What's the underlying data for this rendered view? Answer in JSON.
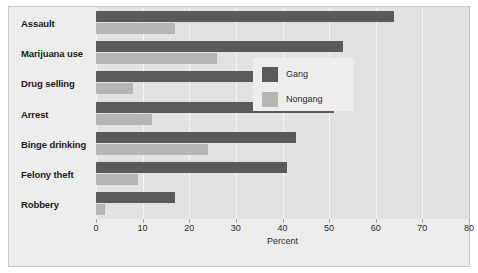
{
  "chart_data": {
    "type": "bar",
    "orientation": "horizontal",
    "title": "",
    "xlabel": "Percent",
    "ylabel": "",
    "xlim": [
      0,
      80
    ],
    "xticks": [
      0,
      10,
      20,
      30,
      40,
      50,
      60,
      70,
      80
    ],
    "grid": true,
    "legend_position": "right-center",
    "categories": [
      "Assault",
      "Marijuana use",
      "Drug selling",
      "Arrest",
      "Binge drinking",
      "Felony theft",
      "Robbery"
    ],
    "series": [
      {
        "name": "Gang",
        "color": "#5a5a5a",
        "values": [
          64,
          53,
          51,
          51,
          43,
          41,
          17
        ]
      },
      {
        "name": "Nongang",
        "color": "#b5b5b5",
        "values": [
          17,
          26,
          8,
          12,
          24,
          9,
          2
        ]
      }
    ]
  },
  "colors": {
    "gang": "#5a5a5a",
    "nongang": "#b5b5b5",
    "plot_background": "#e2e2e2",
    "panel_background": "#ededed",
    "gridline": "#f4f4f4",
    "figure_background": "#ffffff",
    "text": "#1b1b1b"
  }
}
